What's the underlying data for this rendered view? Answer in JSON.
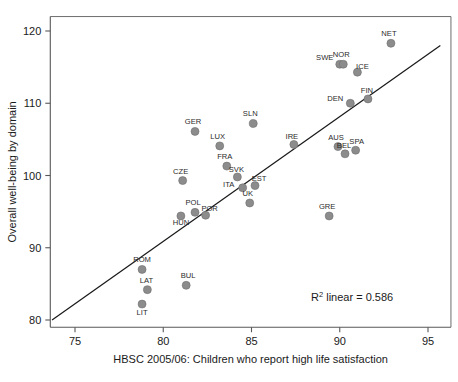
{
  "chart_data": {
    "type": "scatter",
    "title": "",
    "xlabel": "HBSC 2005/06: Children who report high life satisfaction",
    "ylabel": "Overall well-being by domain",
    "xlim": [
      73.6,
      96.3
    ],
    "ylim": [
      79.0,
      122.0
    ],
    "xticks": [
      75,
      80,
      85,
      90,
      95
    ],
    "yticks": [
      80,
      90,
      100,
      110,
      120
    ],
    "xtick_labels": [
      "75",
      "80",
      "85",
      "90",
      "95"
    ],
    "ytick_labels": [
      "80",
      "90",
      "100",
      "110",
      "120"
    ],
    "grid": false,
    "legend": null,
    "annotations": [
      {
        "name": "r2-annotation",
        "text_prefix": "R",
        "text_sup": "2",
        "text_suffix": " linear = 0.586",
        "full_text": "R2 linear = 0.586",
        "value": 0.586,
        "x": 90.7,
        "y": 82.6
      }
    ],
    "fit_line": {
      "name": "linear-fit-line",
      "x_start": 73.7,
      "y_start": 80.0,
      "x_end": 95.7,
      "y_end": 118.0,
      "color": "#1a1a1a"
    },
    "marker_color": "#8c8c8c",
    "marker_radius": 4.0,
    "points": [
      {
        "label": "NET",
        "x": 92.9,
        "y": 118.3,
        "label_dx": -2,
        "label_dy": -7
      },
      {
        "label": "SWE",
        "x": 90.0,
        "y": 115.4,
        "label_dx": -15,
        "label_dy": -4,
        "hidden_marker": false
      },
      {
        "label": "NOR",
        "x": 90.2,
        "y": 115.4,
        "label_dx": -2,
        "label_dy": -7
      },
      {
        "label": "ICE",
        "x": 91.0,
        "y": 114.3,
        "label_dx": 5,
        "label_dy": -3
      },
      {
        "label": "FIN",
        "x": 91.6,
        "y": 110.6,
        "label_dx": -1,
        "label_dy": -6
      },
      {
        "label": "DEN",
        "x": 90.6,
        "y": 110.0,
        "label_dx": -15,
        "label_dy": -2
      },
      {
        "label": "SLN",
        "x": 85.1,
        "y": 107.2,
        "label_dx": -3,
        "label_dy": -7
      },
      {
        "label": "GER",
        "x": 81.8,
        "y": 106.1,
        "label_dx": -2,
        "label_dy": -7
      },
      {
        "label": "IRE",
        "x": 87.4,
        "y": 104.3,
        "label_dx": -2,
        "label_dy": -5
      },
      {
        "label": "LUX",
        "x": 83.2,
        "y": 104.1,
        "label_dx": -2,
        "label_dy": -7
      },
      {
        "label": "AUS",
        "x": 89.9,
        "y": 104.0,
        "label_dx": -2,
        "label_dy": -7
      },
      {
        "label": "SPA",
        "x": 90.9,
        "y": 103.5,
        "label_dx": 1,
        "label_dy": -6
      },
      {
        "label": "BEL",
        "x": 90.3,
        "y": 103.0,
        "label_dx": -1,
        "label_dy": -6
      },
      {
        "label": "FRA",
        "x": 83.6,
        "y": 101.3,
        "label_dx": -2,
        "label_dy": -7
      },
      {
        "label": "SVK",
        "x": 84.2,
        "y": 99.8,
        "label_dx": -1,
        "label_dy": -5
      },
      {
        "label": "CZE",
        "x": 81.1,
        "y": 99.3,
        "label_dx": -2,
        "label_dy": -7
      },
      {
        "label": "EST",
        "x": 85.2,
        "y": 98.6,
        "label_dx": 4,
        "label_dy": -5
      },
      {
        "label": "ITA",
        "x": 84.5,
        "y": 98.3,
        "label_dx": -14,
        "label_dy": -1
      },
      {
        "label": "UK",
        "x": 84.9,
        "y": 96.2,
        "label_dx": -2,
        "label_dy": -7
      },
      {
        "label": "POL",
        "x": 81.8,
        "y": 94.9,
        "label_dx": -2,
        "label_dy": -7
      },
      {
        "label": "POR",
        "x": 82.4,
        "y": 94.5,
        "label_dx": 4,
        "label_dy": -4
      },
      {
        "label": "HUN",
        "x": 81.0,
        "y": 94.4,
        "label_dx": 0,
        "label_dy": 9
      },
      {
        "label": "GRE",
        "x": 89.4,
        "y": 94.4,
        "label_dx": -2,
        "label_dy": -7
      },
      {
        "label": "ROM",
        "x": 78.8,
        "y": 87.0,
        "label_dx": 0,
        "label_dy": -7
      },
      {
        "label": "BUL",
        "x": 81.3,
        "y": 84.8,
        "label_dx": 2,
        "label_dy": -7
      },
      {
        "label": "LAT",
        "x": 79.1,
        "y": 84.2,
        "label_dx": -1,
        "label_dy": -7
      },
      {
        "label": "LIT",
        "x": 78.8,
        "y": 82.2,
        "label_dx": 0,
        "label_dy": 11
      }
    ]
  }
}
